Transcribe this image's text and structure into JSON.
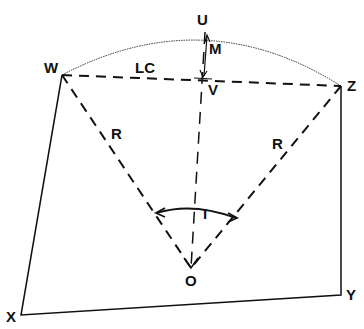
{
  "diagram": {
    "points": {
      "U": {
        "label": "U",
        "x": 205,
        "y": 32
      },
      "W": {
        "label": "W",
        "x": 62,
        "y": 75
      },
      "Z": {
        "label": "Z",
        "x": 341,
        "y": 86
      },
      "V": {
        "label": "V",
        "x": 203,
        "y": 80
      },
      "O": {
        "label": "O",
        "x": 191,
        "y": 268
      },
      "X": {
        "label": "X",
        "x": 21,
        "y": 315
      },
      "Y": {
        "label": "Y",
        "x": 341,
        "y": 295
      }
    },
    "annotations": {
      "M": "M",
      "LC": "LC",
      "R_left": "R",
      "R_right": "R",
      "I": "I"
    },
    "colors": {
      "ink": "#111111",
      "background": "#ffffff"
    }
  }
}
